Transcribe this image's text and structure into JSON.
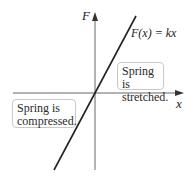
{
  "diagram": {
    "axis_labels": {
      "y": "F",
      "x": "x"
    },
    "equation": "F(x) = kx",
    "regions": {
      "stretched": {
        "lines": [
          "Spring is",
          "stretched."
        ]
      },
      "compressed": {
        "lines": [
          "Spring is",
          "compressed."
        ]
      }
    },
    "colors": {
      "axis": "#555555",
      "line": "#222222",
      "box_border": "#c8c8c8"
    }
  }
}
